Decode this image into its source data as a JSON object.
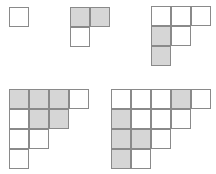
{
  "style": {
    "cell_size": 20,
    "line_color": "#8a8a8a",
    "shade_color": "#d6d6d6",
    "fill_color": "#ffffff"
  },
  "diagrams": [
    {
      "name": "diagram-1",
      "x": 9,
      "y": 7,
      "rows": [
        1
      ],
      "shaded": []
    },
    {
      "name": "diagram-2",
      "x": 70,
      "y": 7,
      "rows": [
        2,
        1
      ],
      "shaded": [
        [
          0,
          0
        ],
        [
          0,
          1
        ]
      ]
    },
    {
      "name": "diagram-3",
      "x": 151,
      "y": 6,
      "rows": [
        3,
        2,
        1
      ],
      "shaded": [
        [
          1,
          0
        ],
        [
          2,
          0
        ]
      ]
    },
    {
      "name": "diagram-4",
      "x": 9,
      "y": 89,
      "rows": [
        4,
        3,
        2,
        1
      ],
      "shaded": [
        [
          0,
          0
        ],
        [
          0,
          1
        ],
        [
          0,
          2
        ],
        [
          1,
          1
        ],
        [
          1,
          2
        ]
      ]
    },
    {
      "name": "diagram-5",
      "x": 111,
      "y": 89,
      "rows": [
        5,
        4,
        3,
        2
      ],
      "shaded": [
        [
          0,
          3
        ],
        [
          1,
          0
        ],
        [
          2,
          0
        ],
        [
          2,
          1
        ],
        [
          3,
          0
        ]
      ]
    }
  ]
}
